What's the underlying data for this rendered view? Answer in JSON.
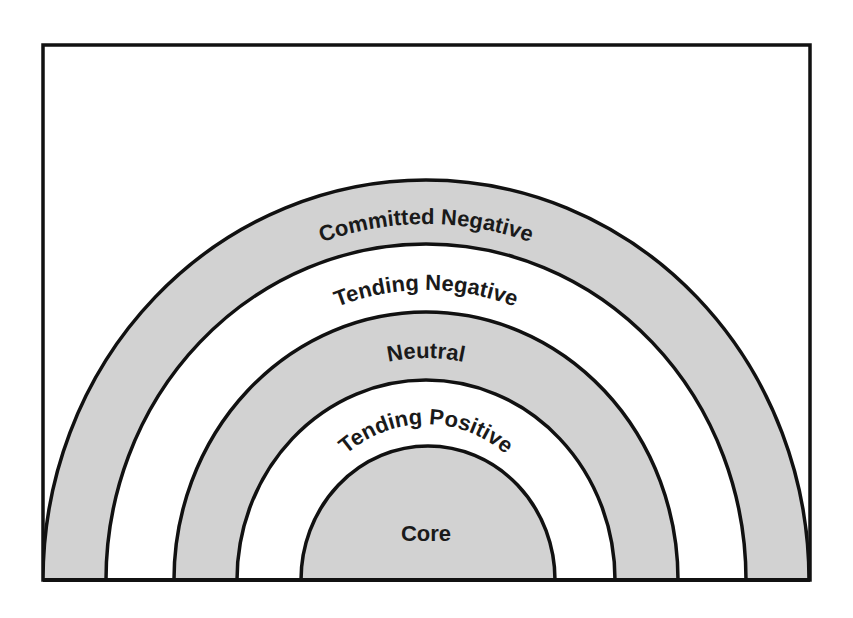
{
  "diagram": {
    "type": "concentric-semicircle",
    "colors": {
      "shaded": "#d2d2d2",
      "unshaded": "#ffffff",
      "stroke": "#111111",
      "frame": "#111111"
    },
    "rings": [
      {
        "label": "Committed Negative",
        "fill": "shaded"
      },
      {
        "label": "Tending Negative",
        "fill": "unshaded"
      },
      {
        "label": "Neutral",
        "fill": "shaded"
      },
      {
        "label": "Tending Positive",
        "fill": "unshaded"
      },
      {
        "label": "Core",
        "fill": "shaded"
      }
    ]
  }
}
